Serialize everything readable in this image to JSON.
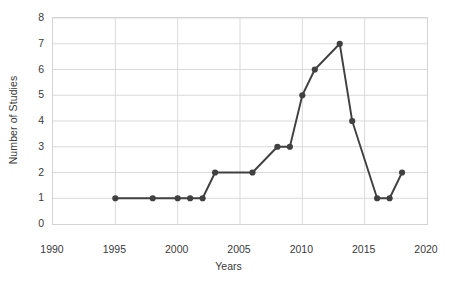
{
  "chart_data": {
    "type": "line",
    "title": "",
    "xlabel": "Years",
    "ylabel": "Number of Studies",
    "xlim": [
      1990,
      2020
    ],
    "ylim": [
      0,
      8
    ],
    "xticks": [
      1990,
      1995,
      2000,
      2005,
      2010,
      2015,
      2020
    ],
    "yticks": [
      0,
      1,
      2,
      3,
      4,
      5,
      6,
      7,
      8
    ],
    "grid": true,
    "legend": "none",
    "series": [
      {
        "name": "Number of Studies",
        "color": "#404040",
        "marker": "circle",
        "x": [
          1995,
          1998,
          2000,
          2001,
          2002,
          2003,
          2006,
          2008,
          2009,
          2010,
          2011,
          2013,
          2014,
          2016,
          2017,
          2018
        ],
        "values": [
          1,
          1,
          1,
          1,
          1,
          2,
          2,
          3,
          3,
          5,
          6,
          7,
          4,
          1,
          1,
          2
        ]
      }
    ]
  },
  "style": {
    "line_color": "#404040",
    "marker_color": "#404040",
    "grid_color": "#d9d9d9",
    "border_color": "#d4d4d4",
    "text_color": "#3a3a3a",
    "background": "#ffffff"
  }
}
